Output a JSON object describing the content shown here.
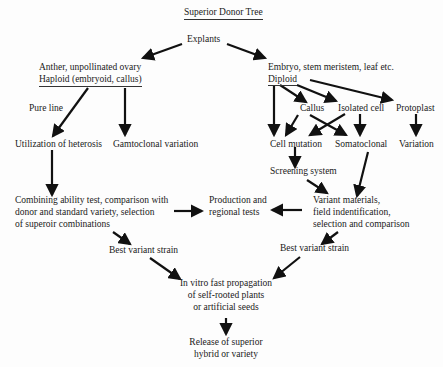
{
  "title": "Superior Donor Tree",
  "nodes": {
    "explants": "Explants",
    "haploid_source": {
      "line1": "Anther, unpollinated ovary",
      "line2": "Haploid (embryoid, callus)"
    },
    "diploid_source": {
      "line1": "Embryo, stem meristem, leaf etc.",
      "line2": "Diploid"
    },
    "pure_line": "Pure line",
    "utilization_heterosis": "Utilization of heterosis",
    "gamtoclonal": "Gamtoclonal variation",
    "callus": "Callus",
    "isolated_cell": "Isolated cell",
    "protoplast": "Protoplast",
    "cell_mutation": "Cell mutation",
    "somatoclonal": "Somatoclonal",
    "variation": "Variation",
    "screening_system": "Screening system",
    "combining_ability": {
      "line1": "Combining ability test, comparison with",
      "line2": "donor and standard variety, selection",
      "line3": "of superoir combinations"
    },
    "production_tests": {
      "line1": "Production and",
      "line2": "regional tests"
    },
    "variant_materials": {
      "line1": "Variant materials,",
      "line2": "field indentification,",
      "line3": "selection and comparison"
    },
    "best_variant_left": "Best variant strain",
    "best_variant_right": "Best variant strain",
    "in_vitro": {
      "line1": "In vitro fast propagation",
      "line2": "of self-rooted plants",
      "line3": "or artificial seeds"
    },
    "release": {
      "line1": "Release of superior",
      "line2": "hybrid or variety"
    }
  },
  "colors": {
    "arrow": "#111111",
    "text": "#1a1a1a",
    "background": "#fdfdfd"
  }
}
